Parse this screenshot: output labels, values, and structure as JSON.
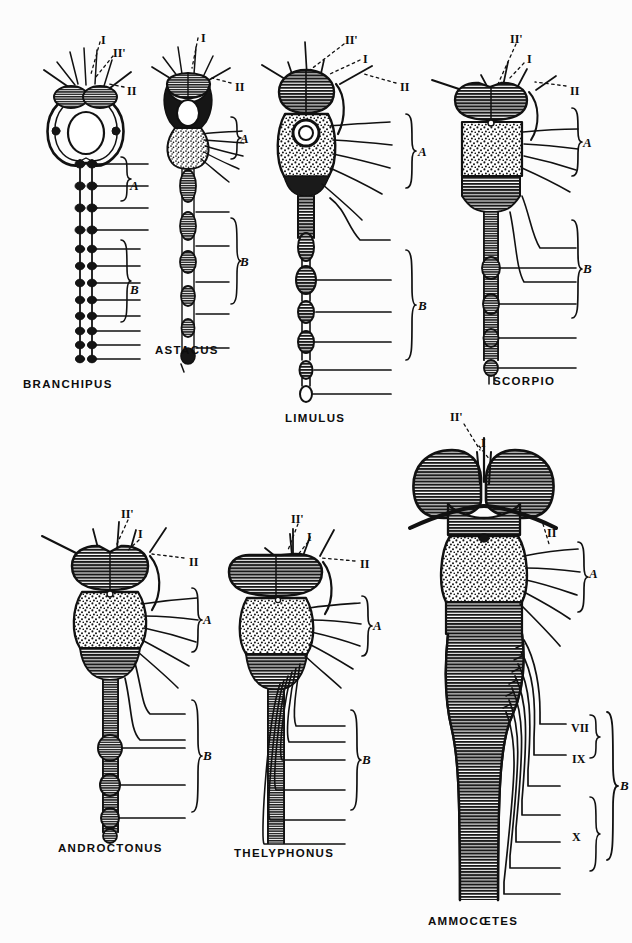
{
  "plate": {
    "background_color": "#fcfcfc",
    "ink_color": "#111111",
    "description": "Comparative anatomical plate of central nervous systems",
    "figures": [
      {
        "id": "branchipus",
        "caption": "BRANCHIPUS",
        "caption_x": 23,
        "caption_y": 378,
        "labels": [
          {
            "text": "I",
            "x": 101,
            "y": 33
          },
          {
            "text": "II'",
            "x": 113,
            "y": 46
          },
          {
            "text": "II",
            "x": 127,
            "y": 84
          }
        ],
        "brackets": [
          {
            "text": "A",
            "x": 130,
            "y": 178
          },
          {
            "text": "B",
            "x": 130,
            "y": 282
          }
        ]
      },
      {
        "id": "astacus",
        "caption": "ASTACUS",
        "caption_x": 155,
        "caption_y": 344,
        "labels": [
          {
            "text": "I",
            "x": 201,
            "y": 31
          },
          {
            "text": "II",
            "x": 235,
            "y": 80
          }
        ],
        "brackets": [
          {
            "text": "A",
            "x": 240,
            "y": 138
          },
          {
            "text": "B",
            "x": 240,
            "y": 262
          }
        ]
      },
      {
        "id": "limulus",
        "caption": "LIMULUS",
        "caption_x": 285,
        "caption_y": 412,
        "labels": [
          {
            "text": "II'",
            "x": 345,
            "y": 33
          },
          {
            "text": "I",
            "x": 363,
            "y": 52
          },
          {
            "text": "II",
            "x": 400,
            "y": 80
          }
        ],
        "brackets": [
          {
            "text": "A",
            "x": 418,
            "y": 155
          },
          {
            "text": "B",
            "x": 418,
            "y": 310
          }
        ]
      },
      {
        "id": "scorpio",
        "caption": "SCORPIO",
        "caption_x": 493,
        "caption_y": 375,
        "labels": [
          {
            "text": "II'",
            "x": 510,
            "y": 32
          },
          {
            "text": "I",
            "x": 527,
            "y": 52
          },
          {
            "text": "II",
            "x": 570,
            "y": 84
          }
        ],
        "brackets": [
          {
            "text": "A",
            "x": 583,
            "y": 145
          },
          {
            "text": "B",
            "x": 583,
            "y": 270
          }
        ]
      },
      {
        "id": "androctonus",
        "caption": "ANDROCTONUS",
        "caption_x": 58,
        "caption_y": 842,
        "labels": [
          {
            "text": "II'",
            "x": 121,
            "y": 507
          },
          {
            "text": "I",
            "x": 138,
            "y": 527
          },
          {
            "text": "II",
            "x": 189,
            "y": 555
          }
        ],
        "brackets": [
          {
            "text": "A",
            "x": 203,
            "y": 622
          },
          {
            "text": "B",
            "x": 203,
            "y": 757
          }
        ]
      },
      {
        "id": "thelyphonus",
        "caption": "THELYPHONUS",
        "caption_x": 234,
        "caption_y": 847,
        "labels": [
          {
            "text": "II'",
            "x": 291,
            "y": 512
          },
          {
            "text": "I",
            "x": 307,
            "y": 530
          },
          {
            "text": "II",
            "x": 360,
            "y": 557
          }
        ],
        "brackets": [
          {
            "text": "A",
            "x": 373,
            "y": 628
          },
          {
            "text": "B",
            "x": 362,
            "y": 762
          }
        ]
      },
      {
        "id": "ammocoetes",
        "caption": "AMMOCŒTES",
        "caption_x": 428,
        "caption_y": 915,
        "labels": [
          {
            "text": "II'",
            "x": 450,
            "y": 415
          },
          {
            "text": "I",
            "x": 481,
            "y": 441
          },
          {
            "text": "II",
            "x": 547,
            "y": 530
          },
          {
            "text": "VII",
            "x": 571,
            "y": 729
          },
          {
            "text": "IX",
            "x": 572,
            "y": 760
          },
          {
            "text": "X",
            "x": 572,
            "y": 838
          }
        ],
        "brackets": [
          {
            "text": "A",
            "x": 589,
            "y": 576
          },
          {
            "text": "B",
            "x": 604,
            "y": 797
          }
        ]
      }
    ]
  }
}
